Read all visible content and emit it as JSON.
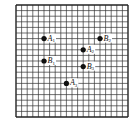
{
  "diagram": {
    "type": "square-grid-with-points",
    "grid": {
      "cols": 20,
      "rows": 20,
      "left": 16,
      "top": 5,
      "cell": 5.6,
      "line_color": "#333333",
      "border_color": "#222222"
    },
    "points": [
      {
        "label": "A",
        "sub": "1",
        "col": 5,
        "row": 6
      },
      {
        "label": "B",
        "sub": "2",
        "col": 15,
        "row": 6
      },
      {
        "label": "A",
        "sub": "2",
        "col": 12,
        "row": 8
      },
      {
        "label": "B",
        "sub": "1",
        "col": 5,
        "row": 10
      },
      {
        "label": "B",
        "sub": "3",
        "col": 12,
        "row": 11
      },
      {
        "label": "A",
        "sub": "3",
        "col": 9,
        "row": 14
      }
    ],
    "point_color": "#111111"
  }
}
